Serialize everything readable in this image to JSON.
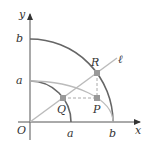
{
  "diagram": {
    "labels": {
      "y_axis": "y",
      "x_axis": "x",
      "origin": "O",
      "y_b": "b",
      "y_a": "a",
      "x_a": "a",
      "x_b": "b",
      "point_R": "R",
      "point_Q": "Q",
      "point_P": "P",
      "line_l": "ℓ"
    },
    "elements": {
      "outer_circle": "circle of radius b (quarter arc)",
      "inner_circle": "circle of radius a (quarter arc)",
      "ellipse": "ellipse with semi-axes b (x) and a (y)",
      "ray": "line ℓ through origin O",
      "dashed_horizontal": "from Q to P",
      "dashed_vertical": "from R to P"
    },
    "colors": {
      "axis": "#555555",
      "dark_arc": "#666666",
      "light_curve": "#bbbbbb",
      "points": "#999999"
    }
  }
}
